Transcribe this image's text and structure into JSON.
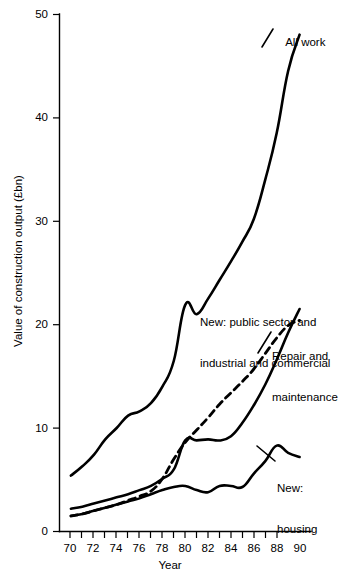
{
  "chart_data": {
    "type": "line",
    "title": "",
    "xlabel": "Year",
    "ylabel": "Value of construction output (£bn)",
    "xlim": [
      69,
      91
    ],
    "ylim": [
      0,
      50
    ],
    "xticks": [
      "70",
      "72",
      "74",
      "76",
      "78",
      "80",
      "82",
      "84",
      "86",
      "88",
      "90"
    ],
    "xtick_values": [
      70,
      72,
      74,
      76,
      78,
      80,
      82,
      84,
      86,
      88,
      90
    ],
    "yticks": [
      "0",
      "10",
      "20",
      "30",
      "40",
      "50"
    ],
    "ytick_values": [
      0,
      10,
      20,
      30,
      40,
      50
    ],
    "grid": false,
    "legend": "inline-annotations",
    "x": [
      70,
      71,
      72,
      73,
      74,
      75,
      76,
      77,
      78,
      79,
      80,
      81,
      82,
      83,
      84,
      85,
      86,
      87,
      88,
      89,
      90
    ],
    "series": [
      {
        "name": "All work",
        "style": "solid",
        "color": "#000000",
        "x": [
          70,
          71,
          72,
          73,
          74,
          75,
          76,
          77,
          78,
          79,
          80,
          81,
          82,
          83,
          84,
          85,
          86,
          87,
          88,
          89,
          90
        ],
        "values": [
          5.4,
          6.3,
          7.4,
          8.9,
          10.0,
          11.2,
          11.6,
          12.4,
          14.0,
          16.5,
          21.9,
          21.0,
          22.5,
          24.3,
          26.1,
          28.0,
          30.2,
          34.0,
          38.5,
          44.5,
          48.0
        ]
      },
      {
        "name": "New: public sector and industrial and commercial",
        "style": "solid",
        "color": "#000000",
        "x": [
          70,
          71,
          72,
          73,
          74,
          75,
          76,
          77,
          78,
          79,
          80,
          81,
          82,
          83,
          84,
          85,
          86,
          87,
          88,
          89,
          90
        ],
        "values": [
          2.2,
          2.4,
          2.7,
          3.0,
          3.3,
          3.6,
          4.0,
          4.4,
          5.1,
          6.0,
          8.8,
          8.8,
          8.9,
          8.8,
          9.2,
          10.5,
          12.2,
          14.2,
          16.6,
          19.2,
          21.5
        ]
      },
      {
        "name": "Repair and maintenance",
        "style": "dashed",
        "color": "#000000",
        "x": [
          70,
          71,
          72,
          73,
          74,
          75,
          76,
          77,
          78,
          79,
          80,
          81,
          82,
          83,
          84,
          85,
          86,
          87,
          88,
          89,
          90
        ],
        "values": [
          1.5,
          1.7,
          2.0,
          2.3,
          2.6,
          3.0,
          3.4,
          3.9,
          5.1,
          7.0,
          8.6,
          9.8,
          11.0,
          12.3,
          13.4,
          14.5,
          15.7,
          17.2,
          18.7,
          19.9,
          20.4
        ]
      },
      {
        "name": "New: housing",
        "style": "solid",
        "color": "#000000",
        "x": [
          70,
          71,
          72,
          73,
          74,
          75,
          76,
          77,
          78,
          79,
          80,
          81,
          82,
          83,
          84,
          85,
          86,
          87,
          88,
          89,
          90
        ],
        "values": [
          1.5,
          1.7,
          2.0,
          2.3,
          2.6,
          2.9,
          3.2,
          3.6,
          4.0,
          4.3,
          4.4,
          4.0,
          3.8,
          4.4,
          4.4,
          4.3,
          5.6,
          6.8,
          8.3,
          7.6,
          7.2
        ]
      }
    ],
    "annotations": [
      {
        "name": "all-work",
        "text": "All work"
      },
      {
        "name": "public-sector",
        "text": "New: public sector and\nindustrial and commercial"
      },
      {
        "name": "repair",
        "text": "Repair and\n  maintenance"
      },
      {
        "name": "housing",
        "text": "New:\nhousing"
      }
    ]
  },
  "axes": {
    "ylabel": "Value of construction output (£bn)",
    "xlabel": "Year",
    "yticks": [
      {
        "label": "50"
      },
      {
        "label": "40"
      },
      {
        "label": "30"
      },
      {
        "label": "20"
      },
      {
        "label": "10"
      },
      {
        "label": "0"
      }
    ],
    "xticks": [
      {
        "label": "70"
      },
      {
        "label": "72"
      },
      {
        "label": "74"
      },
      {
        "label": "76"
      },
      {
        "label": "78"
      },
      {
        "label": "80"
      },
      {
        "label": "82"
      },
      {
        "label": "84"
      },
      {
        "label": "86"
      },
      {
        "label": "88"
      },
      {
        "label": "90"
      }
    ]
  },
  "labels": {
    "all_work": "All work",
    "public_line1": "New: public sector and",
    "public_line2": "industrial and commercial",
    "repair_line1": "Repair and",
    "repair_line2": "maintenance",
    "housing_line1": "New:",
    "housing_line2": "housing"
  },
  "colors": {
    "ink": "#000000",
    "background": "#ffffff"
  }
}
